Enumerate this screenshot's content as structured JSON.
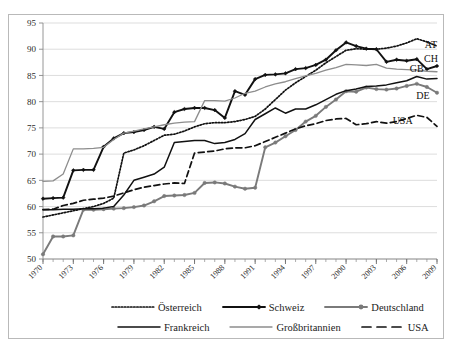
{
  "figure": {
    "caption_fragment": "",
    "frame_border_color": "#b9b9b9",
    "background": "#ffffff"
  },
  "legend": {
    "position": "bottom",
    "rows": [
      [
        {
          "key": "at",
          "label": "Österreich",
          "style": "dotted",
          "color": "#111111",
          "marker": "none"
        },
        {
          "key": "ch",
          "label": "Schweiz",
          "style": "solid-thick",
          "color": "#111111",
          "marker": "diamond"
        },
        {
          "key": "de",
          "label": "Deutschland",
          "style": "solid-thick",
          "color": "#7a7a7a",
          "marker": "circle"
        }
      ],
      [
        {
          "key": "fr",
          "label": "Frankreich",
          "style": "solid",
          "color": "#111111",
          "marker": "none"
        },
        {
          "key": "gb",
          "label": "Großbritannien",
          "style": "solid-thin",
          "color": "#8d8d8d",
          "marker": "none"
        },
        {
          "key": "us",
          "label": "USA",
          "style": "dashed",
          "color": "#111111",
          "marker": "none"
        }
      ]
    ]
  },
  "end_labels": [
    {
      "key": "at",
      "text": "AT",
      "x": 2008.4,
      "y": 90.2
    },
    {
      "key": "ch",
      "text": "CH",
      "x": 2008.4,
      "y": 87.6
    },
    {
      "key": "gb",
      "text": "GB",
      "x": 2007.0,
      "y": 85.6
    },
    {
      "key": "de",
      "text": "DE",
      "x": 2007.6,
      "y": 80.6
    },
    {
      "key": "us",
      "text": "USA",
      "x": 2005.6,
      "y": 75.8
    }
  ],
  "chart_data": {
    "type": "line",
    "title": "",
    "xlabel": "",
    "ylabel": "",
    "xlim": [
      1970,
      2009
    ],
    "ylim": [
      50,
      95
    ],
    "ytick_step": 5,
    "yticks": [
      50,
      55,
      60,
      65,
      70,
      75,
      80,
      85,
      90,
      95
    ],
    "xticks": [
      1970,
      1973,
      1976,
      1979,
      1982,
      1985,
      1988,
      1991,
      1994,
      1997,
      2000,
      2003,
      2006,
      2009
    ],
    "xtick_labels": [
      "1970",
      "1973",
      "1976",
      "1979",
      "1982",
      "1985",
      "1988",
      "1991",
      "1994",
      "1997",
      "2000",
      "2003",
      "2006",
      "2009"
    ],
    "xtick_rotation": 45,
    "grid": "horizontal",
    "legend_position": "bottom",
    "x": [
      1970,
      1971,
      1972,
      1973,
      1974,
      1975,
      1976,
      1977,
      1978,
      1979,
      1980,
      1981,
      1982,
      1983,
      1984,
      1985,
      1986,
      1987,
      1988,
      1989,
      1990,
      1991,
      1992,
      1993,
      1994,
      1995,
      1996,
      1997,
      1998,
      1999,
      2000,
      2001,
      2002,
      2003,
      2004,
      2005,
      2006,
      2007,
      2008,
      2009
    ],
    "series": [
      {
        "name": "Österreich",
        "key": "at",
        "color": "#111111",
        "style": "dotted",
        "marker": "none",
        "values": [
          58.0,
          58.4,
          58.8,
          59.2,
          59.6,
          60.0,
          60.6,
          61.6,
          70.2,
          70.8,
          71.6,
          72.6,
          73.6,
          73.8,
          74.4,
          75.2,
          75.8,
          76.0,
          76.0,
          76.2,
          76.6,
          77.2,
          78.6,
          80.4,
          82.2,
          83.6,
          84.8,
          86.0,
          87.4,
          88.6,
          89.8,
          90.1,
          90.0,
          90.0,
          90.2,
          90.6,
          91.2,
          92.0,
          91.4,
          90.6
        ]
      },
      {
        "name": "Schweiz",
        "key": "ch",
        "color": "#111111",
        "style": "solid-thick",
        "marker": "diamond",
        "values": [
          61.5,
          61.6,
          61.7,
          66.9,
          67.0,
          67.0,
          71.4,
          73.0,
          74.0,
          74.2,
          74.6,
          75.2,
          74.8,
          78.0,
          78.6,
          78.8,
          78.8,
          78.4,
          76.9,
          82.0,
          81.3,
          84.3,
          85.1,
          85.2,
          85.4,
          86.2,
          86.4,
          87.0,
          88.0,
          89.8,
          91.3,
          90.6,
          90.1,
          90.0,
          87.6,
          88.0,
          87.8,
          88.1,
          86.2,
          86.8
        ]
      },
      {
        "name": "Deutschland",
        "key": "de",
        "color": "#7a7a7a",
        "style": "solid-thick",
        "marker": "circle",
        "values": [
          50.9,
          54.3,
          54.3,
          54.5,
          59.4,
          59.4,
          59.5,
          59.6,
          59.7,
          59.9,
          60.2,
          61.0,
          62.0,
          62.1,
          62.2,
          62.6,
          64.5,
          64.6,
          64.4,
          63.8,
          63.4,
          63.6,
          71.3,
          72.2,
          73.4,
          74.6,
          76.2,
          77.3,
          79.0,
          80.4,
          82.0,
          81.9,
          82.7,
          82.4,
          82.3,
          82.5,
          83.0,
          83.4,
          82.8,
          81.7
        ]
      },
      {
        "name": "Frankreich",
        "key": "fr",
        "color": "#111111",
        "style": "solid",
        "marker": "none",
        "values": [
          59.4,
          59.4,
          59.5,
          59.5,
          59.6,
          59.6,
          59.7,
          60.0,
          62.2,
          65.0,
          65.6,
          66.2,
          67.5,
          72.2,
          72.4,
          72.6,
          72.6,
          72.0,
          72.2,
          72.8,
          73.9,
          76.6,
          77.7,
          78.8,
          77.8,
          78.6,
          78.6,
          79.4,
          80.4,
          81.4,
          82.1,
          82.4,
          82.9,
          83.0,
          83.2,
          83.6,
          84.0,
          84.8,
          84.3,
          84.4
        ]
      },
      {
        "name": "Großbritannien",
        "key": "gb",
        "color": "#8d8d8d",
        "style": "solid-thin",
        "marker": "none",
        "values": [
          64.8,
          64.9,
          66.2,
          71.0,
          71.0,
          71.1,
          71.3,
          72.8,
          74.0,
          74.4,
          74.8,
          75.2,
          75.6,
          75.9,
          76.1,
          76.2,
          80.2,
          80.2,
          80.1,
          80.7,
          81.6,
          82.0,
          82.8,
          83.4,
          83.8,
          84.4,
          84.9,
          85.4,
          86.0,
          86.5,
          87.1,
          87.0,
          86.9,
          87.1,
          86.4,
          86.2,
          86.1,
          86.0,
          85.8,
          85.7
        ]
      },
      {
        "name": "USA",
        "key": "us",
        "color": "#111111",
        "style": "dashed",
        "marker": "none",
        "values": [
          59.4,
          59.5,
          60.2,
          60.6,
          61.2,
          61.4,
          61.6,
          62.0,
          62.6,
          63.2,
          63.7,
          64.0,
          64.3,
          64.5,
          64.4,
          70.2,
          70.4,
          70.6,
          71.0,
          71.2,
          71.2,
          71.6,
          72.4,
          73.2,
          74.0,
          74.8,
          75.4,
          75.8,
          76.4,
          76.7,
          76.8,
          75.6,
          75.8,
          76.2,
          75.9,
          76.2,
          76.8,
          77.4,
          77.0,
          75.3
        ]
      }
    ]
  }
}
